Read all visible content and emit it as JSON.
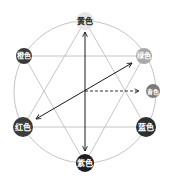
{
  "diagram": {
    "title": "",
    "nodes": [
      {
        "id": "yellow",
        "label": "黄色",
        "x": 85,
        "y": 21,
        "r": 9,
        "fill": "#e6e6e6",
        "text": "#222222"
      },
      {
        "id": "orange",
        "label": "橙色",
        "x": 24,
        "y": 56,
        "r": 8,
        "fill": "#3a3a3a",
        "text": "#ffffff"
      },
      {
        "id": "green",
        "label": "绿色",
        "x": 144,
        "y": 56,
        "r": 8,
        "fill": "#a8a8a8",
        "text": "#ffffff"
      },
      {
        "id": "cyan",
        "label": "青色",
        "x": 153,
        "y": 91,
        "r": 7,
        "fill": "#7a7a7a",
        "text": "#ffffff"
      },
      {
        "id": "red",
        "label": "红色",
        "x": 23,
        "y": 127,
        "r": 10,
        "fill": "#3c3c3c",
        "text": "#ffffff"
      },
      {
        "id": "blue",
        "label": "蓝色",
        "x": 146,
        "y": 127,
        "r": 10,
        "fill": "#2e2e2e",
        "text": "#ffffff"
      },
      {
        "id": "purple",
        "label": "紫色",
        "x": 85,
        "y": 163,
        "r": 9,
        "fill": "#1e1e1e",
        "text": "#ffffff"
      }
    ],
    "circle": {
      "cx": 85,
      "cy": 92,
      "r": 71,
      "stroke": "#b5b5b5"
    },
    "colors": {
      "line": "#b8b8b8",
      "arrow": "#1a1a1a"
    }
  }
}
